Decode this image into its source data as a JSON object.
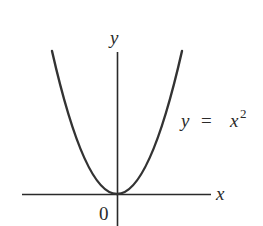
{
  "diagram": {
    "axes": {
      "x_label": "x",
      "y_label": "y",
      "origin_label": "0"
    },
    "curve": {
      "equation_lhs": "y",
      "equation_eq": "=",
      "equation_base": "x",
      "equation_exp": "2",
      "type": "parabola",
      "color": "#333333"
    },
    "colors": {
      "axis": "#2a2a2a",
      "curve": "#333333",
      "background": "#ffffff"
    }
  }
}
